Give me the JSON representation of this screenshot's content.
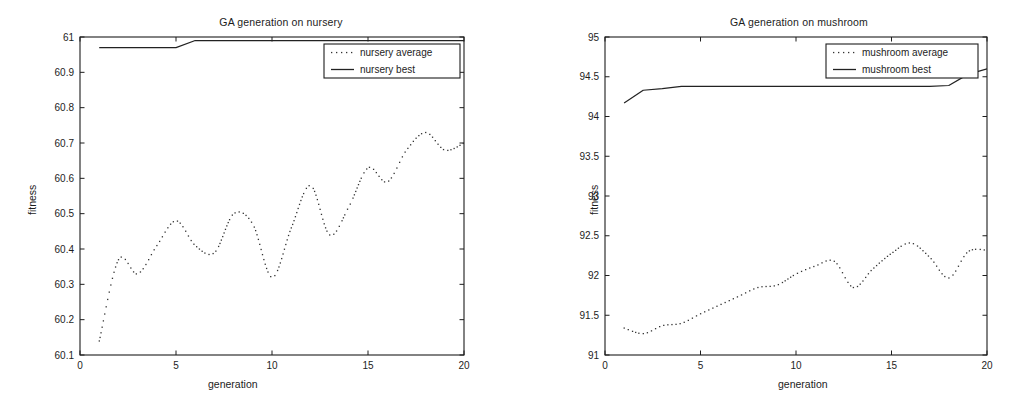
{
  "page": {
    "background": "#ffffff",
    "ink": "#1a1a1a",
    "width": 1028,
    "height": 414
  },
  "figures": [
    {
      "id": "nursery",
      "title": "GA generation on nursery",
      "xlabel": "generation",
      "ylabel": "fitness",
      "legend": {
        "position": "top-right",
        "entries": [
          {
            "label": "nursery average",
            "style": "dotted"
          },
          {
            "label": "nursery best",
            "style": "solid"
          }
        ]
      }
    },
    {
      "id": "mushroom",
      "title": "GA generation on mushroom",
      "xlabel": "generation",
      "ylabel": "fitness",
      "legend": {
        "position": "top-right",
        "entries": [
          {
            "label": "mushroom average",
            "style": "dotted"
          },
          {
            "label": "mushroom best",
            "style": "solid"
          }
        ]
      }
    }
  ],
  "chart_data": [
    {
      "type": "line",
      "id": "nursery",
      "title": "GA generation on nursery",
      "xlabel": "generation",
      "ylabel": "fitness",
      "xlim": [
        0,
        20
      ],
      "ylim": [
        60.1,
        61.0
      ],
      "xticks": [
        0,
        5,
        10,
        15,
        20
      ],
      "xtick_labels": [
        "0",
        "5",
        "10",
        "15",
        "20"
      ],
      "yticks": [
        60.1,
        60.2,
        60.3,
        60.4,
        60.5,
        60.6,
        60.7,
        60.8,
        60.9,
        61.0
      ],
      "ytick_labels": [
        "60.1",
        "60.2",
        "60.3",
        "60.4",
        "60.5",
        "60.6",
        "60.7",
        "60.8",
        "60.9",
        "61"
      ],
      "grid": false,
      "legend_position": "upper right",
      "x": [
        1,
        2,
        3,
        4,
        5,
        6,
        7,
        8,
        9,
        10,
        11,
        12,
        13,
        14,
        15,
        16,
        17,
        18,
        19,
        20
      ],
      "series": [
        {
          "name": "nursery average",
          "style": "dotted",
          "color": "#333333",
          "values": [
            60.14,
            60.37,
            60.33,
            60.41,
            60.48,
            60.41,
            60.39,
            60.5,
            60.47,
            60.32,
            60.46,
            60.58,
            60.44,
            60.52,
            60.63,
            60.59,
            60.68,
            60.73,
            60.68,
            60.7
          ]
        },
        {
          "name": "nursery best",
          "style": "solid",
          "color": "#222222",
          "values": [
            60.97,
            60.97,
            60.97,
            60.97,
            60.97,
            60.99,
            60.99,
            60.99,
            60.99,
            60.99,
            60.99,
            60.99,
            60.99,
            60.99,
            60.99,
            60.99,
            60.99,
            60.99,
            60.99,
            60.99
          ]
        }
      ]
    },
    {
      "type": "line",
      "id": "mushroom",
      "title": "GA generation on mushroom",
      "xlabel": "generation",
      "ylabel": "fitness",
      "xlim": [
        0,
        20
      ],
      "ylim": [
        91,
        95
      ],
      "xticks": [
        0,
        5,
        10,
        15,
        20
      ],
      "xtick_labels": [
        "0",
        "5",
        "10",
        "15",
        "20"
      ],
      "yticks": [
        91,
        91.5,
        92,
        92.5,
        93,
        93.5,
        94,
        94.5,
        95
      ],
      "ytick_labels": [
        "91",
        "91.5",
        "92",
        "92.5",
        "93",
        "93.5",
        "94",
        "94.5",
        "95"
      ],
      "grid": false,
      "legend_position": "upper right",
      "x": [
        1,
        2,
        3,
        4,
        5,
        6,
        7,
        8,
        9,
        10,
        11,
        12,
        13,
        14,
        15,
        16,
        17,
        18,
        19,
        20
      ],
      "series": [
        {
          "name": "mushroom average",
          "style": "dotted",
          "color": "#333333",
          "values": [
            91.34,
            91.27,
            91.37,
            91.4,
            91.52,
            91.63,
            91.74,
            91.85,
            91.88,
            92.02,
            92.12,
            92.18,
            91.85,
            92.08,
            92.28,
            92.41,
            92.23,
            91.97,
            92.3,
            92.32
          ]
        },
        {
          "name": "mushroom best",
          "style": "solid",
          "color": "#222222",
          "values": [
            94.17,
            94.33,
            94.35,
            94.38,
            94.38,
            94.38,
            94.38,
            94.38,
            94.38,
            94.38,
            94.38,
            94.38,
            94.38,
            94.38,
            94.38,
            94.38,
            94.38,
            94.39,
            94.53,
            94.6
          ]
        }
      ]
    }
  ]
}
